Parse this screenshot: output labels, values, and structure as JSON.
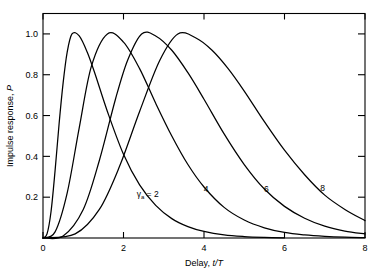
{
  "chart_data": {
    "type": "line",
    "title": "",
    "xlabel": "Delay, t/T",
    "ylabel": "Impulse response, P",
    "xlim": [
      0,
      8
    ],
    "ylim": [
      0,
      1.1
    ],
    "grid": false,
    "legend_position": "inline-annotations",
    "x_ticks": [
      "0",
      "2",
      "4",
      "6",
      "8"
    ],
    "x_tick_values": [
      0,
      2,
      4,
      6,
      8
    ],
    "y_ticks": [
      "0.2",
      "0.4",
      "0.6",
      "0.8",
      "1.0"
    ],
    "y_tick_values": [
      0.2,
      0.4,
      0.6,
      0.8,
      1.0
    ],
    "parameter_symbol": "γₐ =",
    "series": [
      {
        "name": "γₐ = 2",
        "gamma": 2,
        "label": "2",
        "peak_x": 0.72,
        "peak_y": 1.0,
        "x": [
          0,
          0.1,
          0.2,
          0.3,
          0.4,
          0.5,
          0.6,
          0.72,
          0.9,
          1.1,
          1.3,
          1.6,
          2.0,
          2.4,
          2.8,
          3.2,
          3.6,
          4.0,
          4.5,
          5.0,
          5.5,
          6.0
        ],
        "values": [
          0,
          0.02,
          0.13,
          0.33,
          0.56,
          0.76,
          0.91,
          1.0,
          0.99,
          0.91,
          0.8,
          0.62,
          0.41,
          0.26,
          0.16,
          0.095,
          0.056,
          0.032,
          0.015,
          0.007,
          0.003,
          0.001
        ]
      },
      {
        "name": "γₐ = 4",
        "gamma": 4,
        "label": "4",
        "peak_x": 1.6,
        "peak_y": 1.0,
        "x": [
          0,
          0.3,
          0.6,
          0.9,
          1.2,
          1.6,
          2.0,
          2.4,
          2.8,
          3.2,
          3.6,
          4.0,
          4.5,
          5.0,
          5.5,
          6.0,
          6.5,
          7.0,
          7.5,
          8.0
        ],
        "values": [
          0,
          0.03,
          0.22,
          0.54,
          0.84,
          1.0,
          0.96,
          0.83,
          0.66,
          0.5,
          0.36,
          0.25,
          0.15,
          0.088,
          0.05,
          0.027,
          0.015,
          0.008,
          0.004,
          0.002
        ]
      },
      {
        "name": "γₐ = 6",
        "gamma": 6,
        "label": "6",
        "peak_x": 2.45,
        "peak_y": 1.0,
        "x": [
          0,
          0.5,
          1.0,
          1.4,
          1.8,
          2.1,
          2.45,
          2.8,
          3.2,
          3.6,
          4.0,
          4.5,
          5.0,
          5.5,
          6.0,
          6.5,
          7.0,
          7.5,
          8.0
        ],
        "values": [
          0,
          0.01,
          0.14,
          0.38,
          0.68,
          0.87,
          1.0,
          0.99,
          0.92,
          0.81,
          0.68,
          0.51,
          0.36,
          0.24,
          0.155,
          0.097,
          0.058,
          0.034,
          0.02
        ]
      },
      {
        "name": "γₐ = 8",
        "gamma": 8,
        "label": "8",
        "peak_x": 3.35,
        "peak_y": 1.0,
        "x": [
          0,
          0.8,
          1.4,
          1.9,
          2.4,
          2.9,
          3.35,
          3.8,
          4.2,
          4.6,
          5.0,
          5.5,
          6.0,
          6.5,
          7.0,
          7.5,
          8.0
        ],
        "values": [
          0,
          0.02,
          0.14,
          0.35,
          0.62,
          0.87,
          1.0,
          0.98,
          0.92,
          0.83,
          0.72,
          0.57,
          0.43,
          0.31,
          0.21,
          0.14,
          0.085
        ]
      }
    ],
    "annotations": [
      {
        "text": "γₐ = 2",
        "x": 2.6,
        "y": 0.2
      },
      {
        "text": "4",
        "x": 4.05,
        "y": 0.225
      },
      {
        "text": "6",
        "x": 5.55,
        "y": 0.225
      },
      {
        "text": "8",
        "x": 6.95,
        "y": 0.23
      }
    ]
  },
  "axes": {
    "x_label_prefix": "Delay, ",
    "x_label_var": "t/T",
    "y_label": "Impulse response, ",
    "y_label_var": "P"
  }
}
